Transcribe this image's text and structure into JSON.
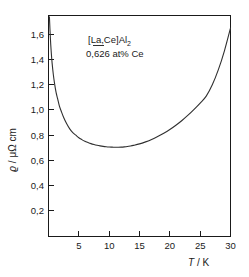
{
  "figure": {
    "background_color": "#ffffff",
    "ink_color": "#1a1a1a",
    "curve_color": "#303030"
  },
  "annotation": {
    "line1_prefix": "[",
    "line1_underlined": "La",
    "line1_mid": ",Ce]Al",
    "line1_sub": "2",
    "line2": "0,626 at% Ce"
  },
  "axes": {
    "x_title_symbol": "T",
    "x_title_rest": " / K",
    "y_title_symbol": "ϱ",
    "y_title_rest": " / μΩ cm"
  },
  "chart_data": {
    "type": "line",
    "title": "",
    "subtitle": "",
    "xlabel": "T / K",
    "ylabel": "ϱ / μΩ cm",
    "xlim": [
      0,
      30
    ],
    "ylim": [
      0,
      1.75
    ],
    "grid": false,
    "legend": null,
    "xticks": [
      5,
      10,
      15,
      20,
      25,
      30
    ],
    "xticklabels": [
      "5",
      "10",
      "15",
      "20",
      "25",
      "30"
    ],
    "yticks": [
      0.2,
      0.4,
      0.6,
      0.8,
      1.0,
      1.2,
      1.4,
      1.6
    ],
    "yticklabels": [
      "0,2",
      "0,4",
      "0,6",
      "0,8",
      "1,0",
      "1,2",
      "1,4",
      "1,6"
    ],
    "annotations": [
      "[La,Ce]Al2",
      "0,626 at% Ce"
    ],
    "series": [
      {
        "name": "resistivity",
        "x": [
          0.15,
          0.3,
          0.45,
          0.6,
          0.8,
          1.0,
          1.25,
          1.5,
          1.8,
          2.1,
          2.5,
          3.0,
          3.5,
          4.0,
          4.5,
          5.0,
          5.5,
          6.0,
          6.5,
          7.0,
          7.5,
          8.0,
          8.5,
          9.0,
          9.5,
          10.0,
          10.5,
          11.0,
          11.5,
          12.0,
          12.5,
          13.0,
          13.5,
          14.0,
          15.0,
          16.0,
          17.0,
          18.0,
          19.0,
          20.0,
          21.0,
          22.0,
          23.0,
          24.0,
          25.0,
          26.0,
          27.0,
          28.0,
          29.0,
          30.0
        ],
        "y": [
          1.74,
          1.58,
          1.46,
          1.37,
          1.28,
          1.21,
          1.14,
          1.09,
          1.03,
          0.99,
          0.94,
          0.89,
          0.85,
          0.82,
          0.8,
          0.78,
          0.765,
          0.752,
          0.742,
          0.733,
          0.726,
          0.72,
          0.715,
          0.711,
          0.708,
          0.706,
          0.705,
          0.704,
          0.704,
          0.705,
          0.707,
          0.71,
          0.714,
          0.719,
          0.731,
          0.747,
          0.766,
          0.789,
          0.815,
          0.845,
          0.879,
          0.917,
          0.959,
          1.005,
          1.055,
          1.11,
          1.2,
          1.32,
          1.47,
          1.65
        ]
      }
    ]
  }
}
